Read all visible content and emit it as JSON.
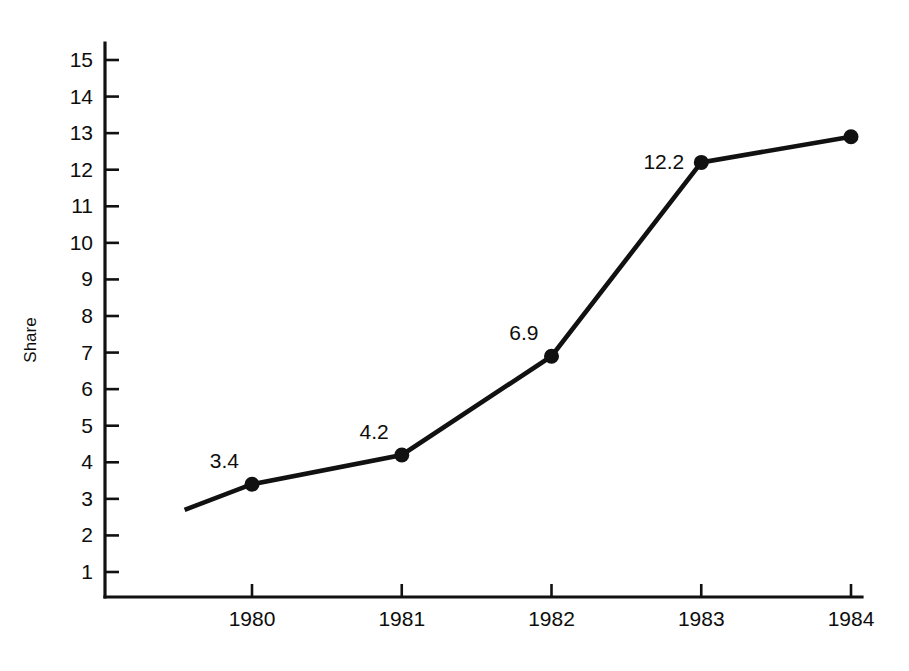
{
  "chart_data": {
    "type": "line",
    "title": "",
    "subtitle": "",
    "xlabel": "",
    "ylabel": "Share",
    "x": [
      1980,
      1981,
      1982,
      1983,
      1984
    ],
    "categories": [
      "1980",
      "1981",
      "1982",
      "1983",
      "1984"
    ],
    "values": [
      3.4,
      4.2,
      6.9,
      12.2,
      12.9
    ],
    "point_labels": [
      "3.4",
      "4.2",
      "6.9",
      "12.2",
      ""
    ],
    "series": [
      {
        "name": "Share",
        "values": [
          3.4,
          4.2,
          6.9,
          12.2,
          12.9
        ]
      }
    ],
    "ylim": [
      0,
      15.4
    ],
    "xlim": [
      1979.55,
      1984.1
    ],
    "ytick_labels": [
      "15",
      "14",
      "13",
      "12",
      "11",
      "10",
      "9",
      "8",
      "7",
      "6",
      "5",
      "4",
      "3",
      "2",
      "1"
    ],
    "ytick_values": [
      15,
      14,
      13,
      12,
      11,
      10,
      9,
      8,
      7,
      6,
      5,
      4,
      3,
      2,
      1
    ],
    "xtick_labels": [
      "1980",
      "1981",
      "1982",
      "1983",
      "1984"
    ],
    "grid": false,
    "legend": false,
    "legend_position": "none",
    "line_color": "#111111",
    "marker_color": "#111111",
    "background_color": "#ffffff",
    "lead_in_segment": {
      "x": 1979.55,
      "y": 2.7
    },
    "annotations": []
  }
}
